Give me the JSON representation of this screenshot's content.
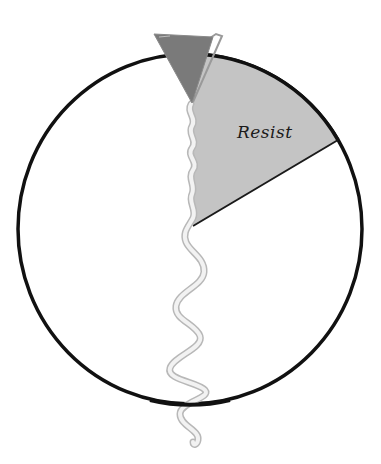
{
  "diagram": {
    "type": "wheel-with-wedge",
    "wedge": {
      "label": "Resist",
      "fill": "#c4c4c4",
      "stroke": "#1a1a1a"
    },
    "circle": {
      "stroke": "#111111",
      "fill": "#ffffff"
    },
    "pointer": {
      "shape": "triangle",
      "fill": "#7a7a7a",
      "outline": "#9a9a9a"
    },
    "ribbon": {
      "shape": "wavy-line",
      "color": "#dcdcdc",
      "outline": "#b8b8b8"
    }
  }
}
